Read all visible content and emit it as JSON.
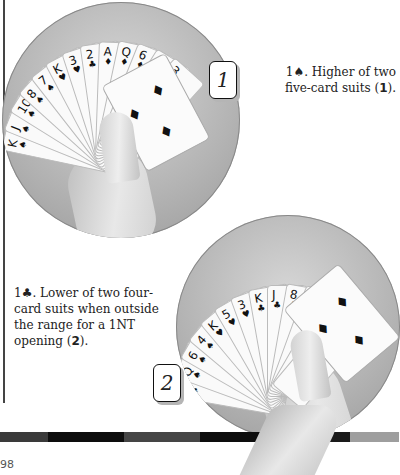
{
  "figure1": {
    "badge": "1",
    "caption_bid": "1",
    "caption_suit": "♠",
    "caption_text": ". Higher of two five-card suits (",
    "caption_ref": "1",
    "caption_end": ").",
    "cards": [
      {
        "rank": "K",
        "suit": "♠"
      },
      {
        "rank": "J",
        "suit": "♠"
      },
      {
        "rank": "10",
        "suit": "♠"
      },
      {
        "rank": "8",
        "suit": "♠"
      },
      {
        "rank": "7",
        "suit": "♠"
      },
      {
        "rank": "K",
        "suit": "♥"
      },
      {
        "rank": "3",
        "suit": "♥"
      },
      {
        "rank": "2",
        "suit": "♣"
      },
      {
        "rank": "A",
        "suit": "♦"
      },
      {
        "rank": "Q",
        "suit": "♦"
      },
      {
        "rank": "6",
        "suit": "♦"
      },
      {
        "rank": "4",
        "suit": "♦"
      },
      {
        "rank": "3",
        "suit": "♦"
      }
    ]
  },
  "figure2": {
    "badge": "2",
    "caption_bid": "1",
    "caption_suit": "♣",
    "caption_text": ". Lower of two four-card suits when outside the range for a 1NT opening (",
    "caption_ref": "2",
    "caption_end": ").",
    "cards": [
      {
        "rank": "A",
        "suit": "♠"
      },
      {
        "rank": "Q",
        "suit": "♠"
      },
      {
        "rank": "6",
        "suit": "♠"
      },
      {
        "rank": "4",
        "suit": "♠"
      },
      {
        "rank": "K",
        "suit": "♥"
      },
      {
        "rank": "5",
        "suit": "♥"
      },
      {
        "rank": "3",
        "suit": "♥"
      },
      {
        "rank": "K",
        "suit": "♣"
      },
      {
        "rank": "J",
        "suit": "♣"
      },
      {
        "rank": "8",
        "suit": "♣"
      },
      {
        "rank": "2",
        "suit": "♣"
      },
      {
        "rank": "7",
        "suit": "♦"
      },
      {
        "rank": "4",
        "suit": "♦"
      }
    ]
  },
  "footer": {
    "page_number": "98",
    "bar_colors": [
      "#3a3a3a",
      "#0d0d0d",
      "#454545",
      "#0d0d0d",
      "#1a1a1a",
      "#9e9e9e"
    ]
  }
}
